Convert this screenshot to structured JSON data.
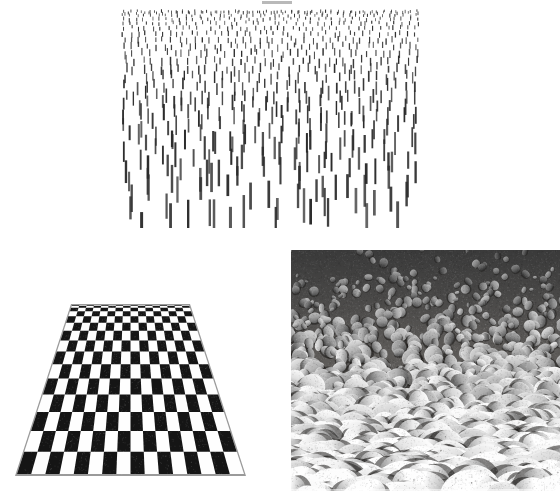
{
  "figure": {
    "title": "Texture gradients as depth cues",
    "background_color": "#ffffff",
    "width": 560,
    "height": 491,
    "scan_artifact": {
      "label": "cropped caption bar",
      "color": "#b9b9b9",
      "x": 262,
      "y": 1,
      "width": 30,
      "height": 3
    }
  },
  "panels": [
    {
      "id": "dashes",
      "name": "dash-texture-gradient",
      "description": "Field of short vertical dashes that grow longer, thicker and sparser toward the bottom, producing an impression of a receding ground plane.",
      "x": 120,
      "y": 8,
      "width": 300,
      "height": 220,
      "ink_color": "#2b2b2b",
      "element_shape": "vertical-dash",
      "rows": 26,
      "columns_far": 46,
      "columns_near": 9,
      "dash_length_far": 3.0,
      "dash_length_near": 30.0,
      "dash_width_far": 0.9,
      "dash_width_near": 2.6,
      "jitter": 0.38,
      "seed": 20240716
    },
    {
      "id": "checkerboard",
      "name": "perspective-checkerboard-floor",
      "description": "Black and white checkerboard plane drawn in linear perspective; squares compress toward the horizon at the top.",
      "x": 8,
      "y": 296,
      "width": 244,
      "height": 188,
      "dark_color": "#151515",
      "light_color": "#fefefe",
      "edge_color": "#9a9a9a",
      "columns": 16,
      "rows": 15,
      "top_left_x": 64,
      "top_right_x": 181,
      "bottom_left_x": 9,
      "bottom_right_x": 236,
      "top_y": 9,
      "bottom_y": 178,
      "perspective_exponent": 2.05
    },
    {
      "id": "stones",
      "name": "pebble-photograph",
      "description": "Black and white photograph of a shingle beach; pebbles appear large at the bottom of the frame and shrink with distance toward the top.",
      "x": 291,
      "y": 250,
      "width": 269,
      "height": 241,
      "palette": {
        "background_dark": "#4a4a4a",
        "stone_light": "#f2f0ec",
        "stone_mid": "#b4b2ae",
        "stone_shadow": "#5d5b58"
      },
      "stone_count": 1500,
      "stone_radius_far": 3.0,
      "stone_radius_near": 23.0,
      "speckle_density": 0.55,
      "seed": 987611
    }
  ]
}
